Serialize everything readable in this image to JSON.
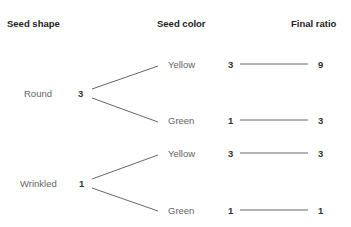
{
  "headers": {
    "shape": "Seed shape",
    "color": "Seed color",
    "ratio": "Final ratio"
  },
  "branches": [
    {
      "shape": "Round",
      "shape_value": "3",
      "colors": [
        {
          "label": "Yellow",
          "value": "3",
          "ratio": "9"
        },
        {
          "label": "Green",
          "value": "1",
          "ratio": "3"
        }
      ]
    },
    {
      "shape": "Wrinkled",
      "shape_value": "1",
      "colors": [
        {
          "label": "Yellow",
          "value": "3",
          "ratio": "3"
        },
        {
          "label": "Green",
          "value": "1",
          "ratio": "1"
        }
      ]
    }
  ],
  "colors": {
    "line": "#555555",
    "text": "#666666",
    "header": "#222222"
  }
}
